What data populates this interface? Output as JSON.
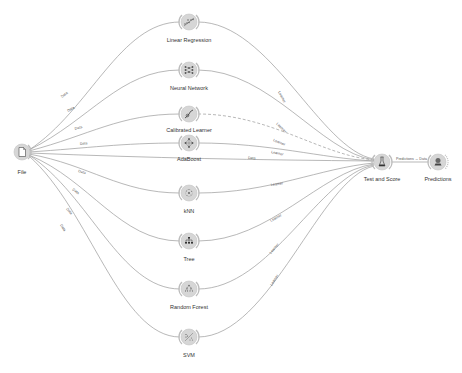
{
  "workflow": {
    "nodes": [
      {
        "id": "file",
        "label": "File",
        "icon": "file-icon",
        "x": 22,
        "y": 152
      },
      {
        "id": "linear_regression",
        "label": "Linear Regression",
        "icon": "linear-regression-icon",
        "x": 189,
        "y": 22
      },
      {
        "id": "neural_network",
        "label": "Neural Network",
        "icon": "neural-network-icon",
        "x": 189,
        "y": 70
      },
      {
        "id": "calibrated_learner",
        "label": "Calibrated Learner",
        "icon": "calibrated-learner-icon",
        "x": 189,
        "y": 114
      },
      {
        "id": "adaboost",
        "label": "AdaBoost",
        "icon": "adaboost-icon",
        "x": 189,
        "y": 143
      },
      {
        "id": "knn",
        "label": "kNN",
        "icon": "knn-icon",
        "x": 189,
        "y": 193
      },
      {
        "id": "tree",
        "label": "Tree",
        "icon": "tree-icon",
        "x": 189,
        "y": 241
      },
      {
        "id": "random_forest",
        "label": "Random Forest",
        "icon": "random-forest-icon",
        "x": 189,
        "y": 289
      },
      {
        "id": "svm",
        "label": "SVM",
        "icon": "svm-icon",
        "x": 189,
        "y": 337
      },
      {
        "id": "test_and_score",
        "label": "Test and Score",
        "icon": "test-and-score-icon",
        "x": 382,
        "y": 162
      },
      {
        "id": "predictions",
        "label": "Predictions",
        "icon": "predictions-icon",
        "x": 438,
        "y": 162
      }
    ],
    "edges": [
      {
        "from": "file",
        "to": "linear_regression",
        "label": "Data"
      },
      {
        "from": "file",
        "to": "neural_network",
        "label": "Data"
      },
      {
        "from": "file",
        "to": "calibrated_learner",
        "label": "Data"
      },
      {
        "from": "file",
        "to": "adaboost",
        "label": "Data"
      },
      {
        "from": "file",
        "to": "test_and_score",
        "label": "Data"
      },
      {
        "from": "file",
        "to": "knn",
        "label": "Data"
      },
      {
        "from": "file",
        "to": "tree",
        "label": "Data"
      },
      {
        "from": "file",
        "to": "random_forest",
        "label": "Data"
      },
      {
        "from": "file",
        "to": "svm",
        "label": "Data"
      },
      {
        "from": "linear_regression",
        "to": "test_and_score",
        "label": "Learner"
      },
      {
        "from": "neural_network",
        "to": "test_and_score",
        "label": "Learner"
      },
      {
        "from": "calibrated_learner",
        "to": "test_and_score",
        "label": "Learner",
        "dashed": true
      },
      {
        "from": "adaboost",
        "to": "test_and_score",
        "label": "Learner"
      },
      {
        "from": "knn",
        "to": "test_and_score",
        "label": "Learner"
      },
      {
        "from": "tree",
        "to": "test_and_score",
        "label": "Learner"
      },
      {
        "from": "random_forest",
        "to": "test_and_score",
        "label": "Learner"
      },
      {
        "from": "svm",
        "to": "test_and_score",
        "label": "Learner"
      },
      {
        "from": "test_and_score",
        "to": "predictions",
        "label": "Predictions → Data"
      }
    ]
  },
  "labels": {
    "file": "File",
    "linear_regression": "Linear Regression",
    "neural_network": "Neural Network",
    "calibrated_learner": "Calibrated Learner",
    "adaboost": "AdaBoost",
    "knn": "kNN",
    "tree": "Tree",
    "random_forest": "Random Forest",
    "svm": "SVM",
    "test_and_score": "Test and Score",
    "predictions": "Predictions",
    "edge_data": "Data",
    "edge_learner": "Learner",
    "edge_predictions": "Predictions → Data"
  }
}
